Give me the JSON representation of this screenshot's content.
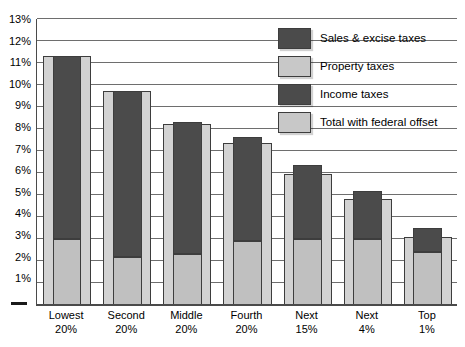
{
  "chart_data": {
    "type": "bar",
    "title": "",
    "subtitle": "",
    "xlabel": "",
    "ylabel": "",
    "grid": true,
    "legend_position": "upper-right",
    "stacked": true,
    "ylim": [
      0,
      13
    ],
    "y_ticks": [
      "1%",
      "2%",
      "3%",
      "4%",
      "5%",
      "6%",
      "7%",
      "8%",
      "9%",
      "10%",
      "11%",
      "12%",
      "13%"
    ],
    "y_tick_values": [
      1,
      2,
      3,
      4,
      5,
      6,
      7,
      8,
      9,
      10,
      11,
      12,
      13
    ],
    "categories": [
      {
        "line1": "Lowest",
        "line2": "20%"
      },
      {
        "line1": "Second",
        "line2": "20%"
      },
      {
        "line1": "Middle",
        "line2": "20%"
      },
      {
        "line1": "Fourth",
        "line2": "20%"
      },
      {
        "line1": "Next",
        "line2": "15%"
      },
      {
        "line1": "Next",
        "line2": "4%"
      },
      {
        "line1": "Top",
        "line2": "1%"
      }
    ],
    "series": [
      {
        "name": "Property taxes",
        "key": "property",
        "color": "#c0c0c0",
        "values": [
          3.0,
          2.2,
          2.3,
          2.9,
          3.0,
          3.0,
          2.4
        ]
      },
      {
        "name": "Sales & excise taxes",
        "key": "sales_excise",
        "color": "#4b4b4b",
        "values": [
          8.3,
          7.55,
          6.0,
          4.75,
          3.35,
          2.2,
          1.1
        ]
      },
      {
        "name": "Income taxes",
        "key": "income",
        "color": "#4b4b4b",
        "values": [
          0,
          0,
          0,
          0,
          0,
          0,
          0
        ]
      },
      {
        "name": "Total with federal offset",
        "key": "total_offset",
        "color": "#d2d2d2",
        "values": [
          11.3,
          9.75,
          8.25,
          7.35,
          5.95,
          4.8,
          3.1
        ]
      }
    ],
    "stack_totals": [
      11.3,
      9.75,
      8.3,
      7.65,
      6.35,
      5.2,
      3.5
    ],
    "legend": [
      {
        "label": "Sales & excise taxes",
        "swatch": "dark"
      },
      {
        "label": "Property taxes",
        "swatch": "light"
      },
      {
        "label": "Income taxes",
        "swatch": "dark"
      },
      {
        "label": "Total with federal offset",
        "swatch": "light"
      }
    ],
    "colors": {
      "dark_gray": "#4b4b4b",
      "mid_gray": "#c0c0c0",
      "light_gray": "#d2d2d2",
      "gridline": "#6e6e6e",
      "axis": "#4a4a4a"
    }
  }
}
